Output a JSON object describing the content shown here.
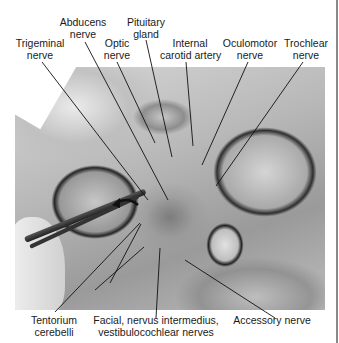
{
  "figure": {
    "type": "labeled anatomical photograph",
    "photo_description": "Dissection of cranial base viewed from above, tentorium cerebelli retracted with forceps",
    "arrow_icon": "curved-arrow-left",
    "labels": [
      {
        "id": "trigeminal",
        "lines": [
          "Trigeminal",
          "nerve"
        ]
      },
      {
        "id": "abducens",
        "lines": [
          "Abducens",
          "nerve"
        ]
      },
      {
        "id": "optic",
        "lines": [
          "Optic",
          "nerve"
        ]
      },
      {
        "id": "pituitary",
        "lines": [
          "Pituitary",
          "gland"
        ]
      },
      {
        "id": "internal_carotid",
        "lines": [
          "Internal",
          "carotid artery"
        ]
      },
      {
        "id": "oculomotor",
        "lines": [
          "Oculomotor",
          "nerve"
        ]
      },
      {
        "id": "trochlear",
        "lines": [
          "Trochlear",
          "nerve"
        ]
      },
      {
        "id": "tentorium",
        "lines": [
          "Tentorium",
          "cerebelli"
        ]
      },
      {
        "id": "facial",
        "lines": [
          "Facial, nervus intermedius,",
          "vestibulocochlear nerves"
        ]
      },
      {
        "id": "accessory",
        "lines": [
          "Accessory nerve"
        ]
      }
    ]
  }
}
